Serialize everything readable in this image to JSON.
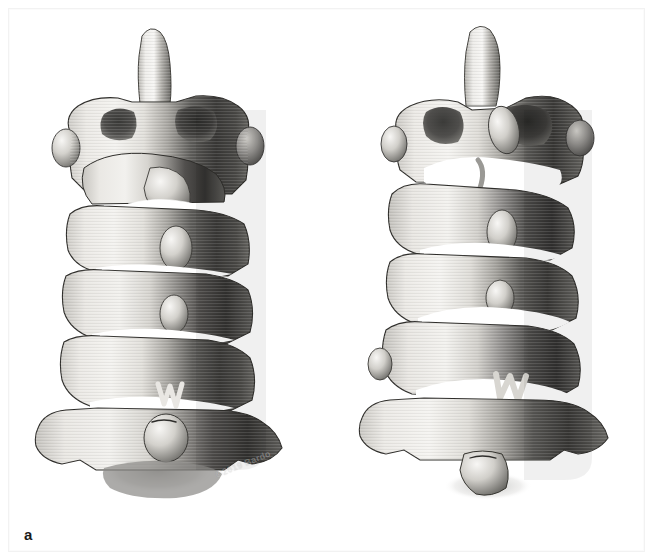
{
  "figure": {
    "type": "anatomical-illustration",
    "modality": "3D volume-rendered reconstruction",
    "view": "anterior / antero-oblique",
    "panel_count": 2,
    "background_color": "#ffffff",
    "bone_light_color": "#ededea",
    "bone_mid_color": "#b9b7b2",
    "bone_shadow_color": "#3a3a38",
    "outline_color": "#2b2b29",
    "gap_color": "#ffffff"
  },
  "panels": [
    {
      "id": "a",
      "label": "a",
      "watermark": "©2019 Bardo",
      "description": "Cervical spine column, neutral alignment, six vertebral segments with odontoid process projecting superiorly",
      "vertebra_count": 6,
      "disc_gaps": 5
    },
    {
      "id": "b",
      "label": "b",
      "watermark": "©2019 Bardo",
      "description": "Cervical spine column, extended alignment, widened anterior intervertebral gaps",
      "vertebra_count": 6,
      "disc_gaps": 5
    }
  ],
  "labels": {
    "panel_a": "a",
    "panel_b": "b"
  },
  "watermarks": {
    "panel_a": "©2019 Bardo",
    "panel_b": "©2019 Bardo"
  }
}
